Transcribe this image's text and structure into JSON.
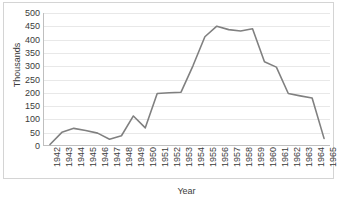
{
  "chart_data": {
    "type": "line",
    "title": "",
    "xlabel": "Year",
    "ylabel": "Thousands",
    "categories": [
      "1942",
      "1943",
      "1944",
      "1945",
      "1946",
      "1947",
      "1948",
      "1949",
      "1950",
      "1951",
      "1952",
      "1953",
      "1954",
      "1955",
      "1956",
      "1957",
      "1958",
      "1959",
      "1960",
      "1961",
      "1962",
      "1963",
      "1964",
      "1965"
    ],
    "values": [
      2,
      48,
      63,
      55,
      45,
      22,
      35,
      110,
      65,
      195,
      198,
      200,
      300,
      410,
      450,
      437,
      432,
      440,
      315,
      295,
      195,
      186,
      178,
      25
    ],
    "series": [
      {
        "name": "Thousands",
        "color": "#808080",
        "values": [
          2,
          48,
          63,
          55,
          45,
          22,
          35,
          110,
          65,
          195,
          198,
          200,
          300,
          410,
          450,
          437,
          432,
          440,
          315,
          295,
          195,
          186,
          178,
          25
        ]
      }
    ],
    "ylim": [
      0,
      500
    ],
    "y_ticks": [
      0,
      50,
      100,
      150,
      200,
      250,
      300,
      350,
      400,
      450,
      500
    ],
    "y_tick_labels": [
      "0",
      "50",
      "100",
      "150",
      "200",
      "250",
      "300",
      "350",
      "400",
      "450",
      "500"
    ],
    "grid": true,
    "grid_axis": "y",
    "legend": false,
    "legend_position": "none",
    "x_tick_rotation": 90,
    "colors": {
      "line": "#808080",
      "gridline": "#e8e8e8",
      "axis": "#bfbfbf",
      "frame": "#d4d4d4",
      "text": "#3b3b3b",
      "background": "#ffffff"
    }
  }
}
